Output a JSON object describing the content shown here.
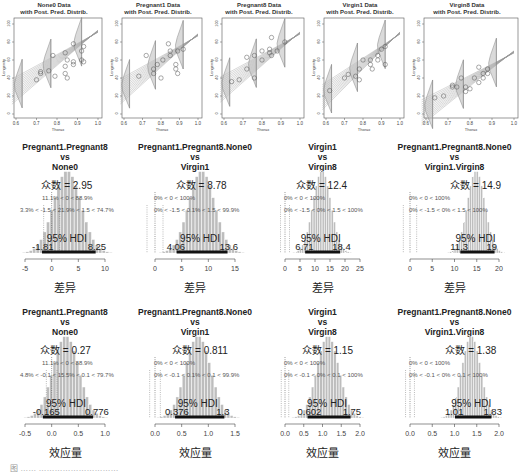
{
  "chart_data": [
    {
      "type": "scatter",
      "title": "None0 Data\nwith Post. Pred. Distrib.",
      "title_lines": [
        "None0 Data",
        "with Post. Pred. Distrib."
      ],
      "xlabel": "Thorax",
      "ylabel": "Longevity",
      "xlim": [
        0.6,
        1.0
      ],
      "ylim": [
        0,
        100
      ],
      "xticks": [
        "0.6",
        "0.7",
        "0.8",
        "0.9",
        "1.0"
      ],
      "yticks": [
        "0",
        "20",
        "40",
        "60",
        "80",
        "100"
      ]
    },
    {
      "type": "scatter",
      "title_lines": [
        "Pregnant1 Data",
        "with Post. Pred. Distrib."
      ],
      "xlabel": "Thorax",
      "ylabel": "Longevity",
      "xlim": [
        0.6,
        1.0
      ],
      "ylim": [
        0,
        100
      ],
      "xticks": [
        "0.6",
        "0.7",
        "0.8",
        "0.9",
        "1.0"
      ],
      "yticks": [
        "0",
        "20",
        "40",
        "60",
        "80",
        "100"
      ]
    },
    {
      "type": "scatter",
      "title_lines": [
        "Pregnant8 Data",
        "with Post. Pred. Distrib."
      ],
      "xlabel": "Thorax",
      "ylabel": "Longevity",
      "xlim": [
        0.6,
        1.0
      ],
      "ylim": [
        0,
        100
      ],
      "xticks": [
        "0.6",
        "0.7",
        "0.8",
        "0.9",
        "1.0"
      ],
      "yticks": [
        "0",
        "20",
        "40",
        "60",
        "80",
        "100"
      ]
    },
    {
      "type": "scatter",
      "title_lines": [
        "Virgin1 Data",
        "with Post. Pred. Distrib."
      ],
      "xlabel": "Thorax",
      "ylabel": "Longevity",
      "xlim": [
        0.6,
        1.0
      ],
      "ylim": [
        0,
        100
      ],
      "xticks": [
        "0.6",
        "0.7",
        "0.8",
        "0.9",
        "1.0"
      ],
      "yticks": [
        "0",
        "20",
        "40",
        "60",
        "80",
        "100"
      ]
    },
    {
      "type": "scatter",
      "title_lines": [
        "Virgin8 Data",
        "with Post. Pred. Distrib."
      ],
      "xlabel": "Thorax",
      "ylabel": "Longevity",
      "xlim": [
        0.6,
        1.0
      ],
      "ylim": [
        0,
        100
      ],
      "xticks": [
        "0.6",
        "0.7",
        "0.8",
        "0.9",
        "1.0"
      ],
      "yticks": [
        "0",
        "20",
        "40",
        "60",
        "80",
        "100"
      ]
    },
    {
      "type": "bar",
      "title_lines": [
        "Pregnant1.Pregnant8",
        "vs",
        "None0"
      ],
      "mode_label": "众数 = 2.95",
      "stat1": "11.1% < 0 < 88.9%",
      "stat2": "3.3% < -1.5 < 21.9% < 1.5 < 74.7%",
      "hdi_label": "95% HDI",
      "hdi_low": "-1.81",
      "hdi_high": "8.25",
      "xticks": [
        "-5",
        "0",
        "5",
        "10"
      ],
      "xlim": [
        -5,
        10
      ],
      "xlabel": "差异",
      "mode": 2.95,
      "hdi": [
        -1.81,
        8.25
      ]
    },
    {
      "type": "bar",
      "title_lines": [
        "Pregnant1.Pregnant8.None0",
        "vs",
        "Virgin1"
      ],
      "mode_label": "众数 = 8.78",
      "stat1": "0% < 0 < 100%",
      "stat2": "0% < -1.5 < 0.1% < 1.5 < 99.9%",
      "hdi_label": "95% HDI",
      "hdi_low": "4.06",
      "hdi_high": "13.6",
      "xticks": [
        "0",
        "5",
        "10",
        "15"
      ],
      "xlim": [
        0,
        15
      ],
      "xlabel": "差异",
      "mode": 8.78,
      "hdi": [
        4.06,
        13.6
      ]
    },
    {
      "type": "bar",
      "title_lines": [
        "Virgin1",
        "vs",
        "Virgin8"
      ],
      "mode_label": "众数 = 12.4",
      "stat1": "0% < 0 < 100%",
      "stat2": "0% < -1.5 < 0% < 1.5 < 100%",
      "hdi_label": "95% HDI",
      "hdi_low": "6.71",
      "hdi_high": "18.4",
      "xticks": [
        "0",
        "5",
        "10",
        "15",
        "20",
        "25"
      ],
      "xlim": [
        0,
        25
      ],
      "xlabel": "差异",
      "mode": 12.4,
      "hdi": [
        6.71,
        18.4
      ]
    },
    {
      "type": "bar",
      "title_lines": [
        "Pregnant1.Pregnant8.None0",
        "vs",
        "Virgin1.Virgin8"
      ],
      "mode_label": "众数 = 14.9",
      "stat1": "0% < 0 < 100%",
      "stat2": "0% < -1.5 < 0% < 1.5 < 100%",
      "hdi_label": "95% HDI",
      "hdi_low": "11.3",
      "hdi_high": "19",
      "xticks": [
        "0",
        "5",
        "10",
        "15",
        "20"
      ],
      "xlim": [
        0,
        20
      ],
      "xlabel": "差异",
      "mode": 14.9,
      "hdi": [
        11.3,
        19
      ]
    },
    {
      "type": "bar",
      "title_lines": [
        "Pregnant1.Pregnant8",
        "vs",
        "None0"
      ],
      "mode_label": "众数 = 0.27",
      "stat1": "11.1% < 0 < 88.9%",
      "stat2": "4.8% < -0.1 < 15.5% < 0.1 < 79.7%",
      "hdi_label": "95% HDI",
      "hdi_low": "-0.165",
      "hdi_high": "0.776",
      "xticks": [
        "-0.5",
        "0.0",
        "0.5",
        "1.0"
      ],
      "xlim": [
        -0.5,
        1.0
      ],
      "xlabel": "效应量",
      "mode": 0.27,
      "hdi": [
        -0.165,
        0.776
      ]
    },
    {
      "type": "bar",
      "title_lines": [
        "Pregnant1.Pregnant8.None0",
        "vs",
        "Virgin1"
      ],
      "mode_label": "众数 = 0.811",
      "stat1": "0% < 0 < 100%",
      "stat2": "0% < -0.1 < 0.1% < 0.1 < 99.9%",
      "hdi_label": "95% HDI",
      "hdi_low": "0.376",
      "hdi_high": "1.3",
      "xticks": [
        "0.0",
        "0.5",
        "1.0",
        "1.5"
      ],
      "xlim": [
        0,
        1.5
      ],
      "xlabel": "效应量",
      "mode": 0.811,
      "hdi": [
        0.376,
        1.3
      ]
    },
    {
      "type": "bar",
      "title_lines": [
        "Virgin1",
        "vs",
        "Virgin8"
      ],
      "mode_label": "众数 = 1.15",
      "stat1": "0% < 0 < 100%",
      "stat2": "0% < -0.1 < 0% < 0.1 < 100%",
      "hdi_label": "95% HDI",
      "hdi_low": "0.602",
      "hdi_high": "1.75",
      "xticks": [
        "0.0",
        "0.5",
        "1.0",
        "1.5",
        "2.0"
      ],
      "xlim": [
        0,
        2.0
      ],
      "xlabel": "效应量",
      "mode": 1.15,
      "hdi": [
        0.602,
        1.75
      ]
    },
    {
      "type": "bar",
      "title_lines": [
        "Pregnant1.Pregnant8.None0",
        "vs",
        "Virgin1.Virgin8"
      ],
      "mode_label": "众数 = 1.38",
      "stat1": "0% < 0 < 100%",
      "stat2": "0% < -0.1 < 0% < 0.1 < 100%",
      "hdi_label": "95% HDI",
      "hdi_low": "1.01",
      "hdi_high": "1.83",
      "xticks": [
        "0.0",
        "0.5",
        "1.0",
        "1.5",
        "2.0"
      ],
      "xlim": [
        0,
        2.0
      ],
      "xlabel": "效应量",
      "mode": 1.38,
      "hdi": [
        1.01,
        1.83
      ]
    }
  ],
  "figure": {
    "caption": "图 ……  …………………………"
  }
}
